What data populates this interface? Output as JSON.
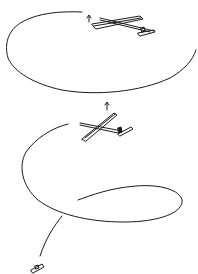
{
  "figure": {
    "width": 198,
    "height": 274,
    "background": "#ffffff",
    "stroke": "#1a1a1a",
    "elements": [
      {
        "name": "flight-path-upper-loop",
        "kind": "curve"
      },
      {
        "name": "glider-upper",
        "kind": "model-airplane-drawing"
      },
      {
        "name": "direction-arrow-upper",
        "kind": "up-arrow"
      },
      {
        "name": "glider-lower",
        "kind": "model-airplane-drawing"
      },
      {
        "name": "direction-arrow-lower",
        "kind": "up-arrow"
      },
      {
        "name": "flight-path-lower-spiral",
        "kind": "curve"
      },
      {
        "name": "tail-fragment-bottom",
        "kind": "small-part-drawing"
      }
    ]
  }
}
